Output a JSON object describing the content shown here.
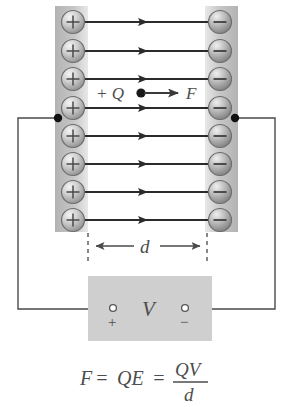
{
  "figure": {
    "formula": {
      "lhs": "F",
      "eq1": "=",
      "mid": "QE",
      "eq2": "=",
      "num": "QV",
      "den": "d"
    }
  },
  "plates": {
    "left": {
      "name": "positive-plate",
      "charge_symbol": "+",
      "charge_count": 8,
      "band_color": "#bdbdbd"
    },
    "right": {
      "name": "negative-plate",
      "charge_symbol": "−",
      "charge_count": 8,
      "band_color": "#bdbdbd"
    }
  },
  "field": {
    "line_count": 8,
    "direction": "left-to-right",
    "line_color": "#2b2b2b"
  },
  "test_charge": {
    "label": "+ Q",
    "force_label": "F",
    "dot_color": "#1a1a1a"
  },
  "dimension": {
    "label": "d",
    "style": "double-headed-arrow"
  },
  "source": {
    "label": "V",
    "positive_terminal": "+",
    "negative_terminal": "−",
    "box_color": "#cfcfcf"
  },
  "circuit": {
    "wire_color": "#4a4a4a",
    "junction_color": "#111111",
    "junction_count": 2
  },
  "colors": {
    "background": "#ffffff",
    "ink": "#3d3d3d",
    "sphere_light": "#f2f2f2",
    "sphere_dark": "#808080"
  }
}
